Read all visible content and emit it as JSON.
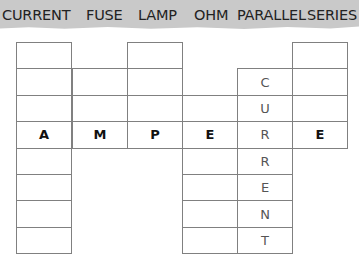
{
  "word_bank": {
    "words": [
      {
        "text": "CURRENT",
        "x": 2
      },
      {
        "text": "FUSE",
        "x": 86
      },
      {
        "text": "LAMP",
        "x": 138
      },
      {
        "text": "OHM",
        "x": 194
      },
      {
        "text": "PARALLEL",
        "x": 237
      },
      {
        "text": "SERIES",
        "x": 307
      }
    ]
  },
  "puzzle": {
    "horizontal_answer": "AMPERE",
    "vertical_answer": "CURRENT",
    "columns": [
      {
        "index": 0,
        "x": 16,
        "rows": [
          0,
          1,
          2,
          3,
          4,
          5,
          6,
          7
        ]
      },
      {
        "index": 1,
        "x": 72,
        "rows": [
          1,
          2,
          3
        ]
      },
      {
        "index": 2,
        "x": 127,
        "rows": [
          0,
          1,
          2,
          3
        ]
      },
      {
        "index": 3,
        "x": 182,
        "rows": [
          2,
          3,
          4,
          5,
          6,
          7
        ]
      },
      {
        "index": 4,
        "x": 237,
        "rows": [
          1,
          2,
          3,
          4,
          5,
          6,
          7
        ]
      },
      {
        "index": 5,
        "x": 292,
        "rows": [
          0,
          1,
          2,
          3
        ]
      }
    ],
    "row_top": 42,
    "row_height": 26.4,
    "filled": [
      {
        "col": 0,
        "row": 3,
        "letter": "A",
        "style": "bold"
      },
      {
        "col": 1,
        "row": 3,
        "letter": "M",
        "style": "bold"
      },
      {
        "col": 2,
        "row": 3,
        "letter": "P",
        "style": "bold"
      },
      {
        "col": 3,
        "row": 3,
        "letter": "E",
        "style": "bold"
      },
      {
        "col": 4,
        "row": 1,
        "letter": "C",
        "style": "hand"
      },
      {
        "col": 4,
        "row": 2,
        "letter": "U",
        "style": "hand"
      },
      {
        "col": 4,
        "row": 3,
        "letter": "R",
        "style": "hand"
      },
      {
        "col": 4,
        "row": 4,
        "letter": "R",
        "style": "hand"
      },
      {
        "col": 4,
        "row": 5,
        "letter": "E",
        "style": "hand"
      },
      {
        "col": 4,
        "row": 6,
        "letter": "N",
        "style": "hand"
      },
      {
        "col": 4,
        "row": 7,
        "letter": "T",
        "style": "hand"
      },
      {
        "col": 5,
        "row": 3,
        "letter": "E",
        "style": "bold"
      }
    ]
  },
  "colors": {
    "banner": "#c9c9c9",
    "banner_text": "#222222",
    "grid_line": "#808080",
    "bold_letter": "#111111",
    "hand_letter": "#555555"
  }
}
